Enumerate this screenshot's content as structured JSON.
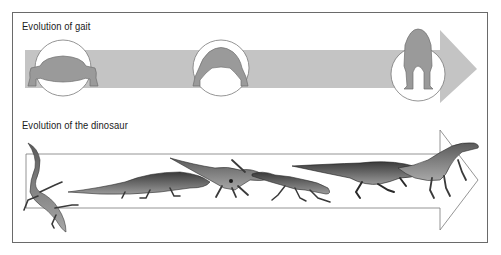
{
  "sections": {
    "gait": {
      "title": "Evolution of gait",
      "stages": [
        {
          "name": "sprawling",
          "icon": "sprawling-gait-icon"
        },
        {
          "name": "semi-erect",
          "icon": "semi-erect-gait-icon"
        },
        {
          "name": "fully-erect",
          "icon": "erect-gait-icon"
        }
      ],
      "arrow_color": "#c4c4c4"
    },
    "dinosaur": {
      "title": "Evolution of the dinosaur",
      "creatures": [
        {
          "name": "early-lizard-like-reptile"
        },
        {
          "name": "crocodile-like-archosaur"
        },
        {
          "name": "semi-erect-archosaur"
        },
        {
          "name": "small-running-archosaur"
        },
        {
          "name": "large-predatory-archosaur"
        },
        {
          "name": "early-dinosaur"
        }
      ],
      "arrow_color": "#ffffff"
    }
  },
  "colors": {
    "figure_fill": "#9a9a9a",
    "figure_stroke": "#6e6e6e",
    "creature_dark": "#4a4a4a",
    "frame": "#6a6a6a"
  }
}
